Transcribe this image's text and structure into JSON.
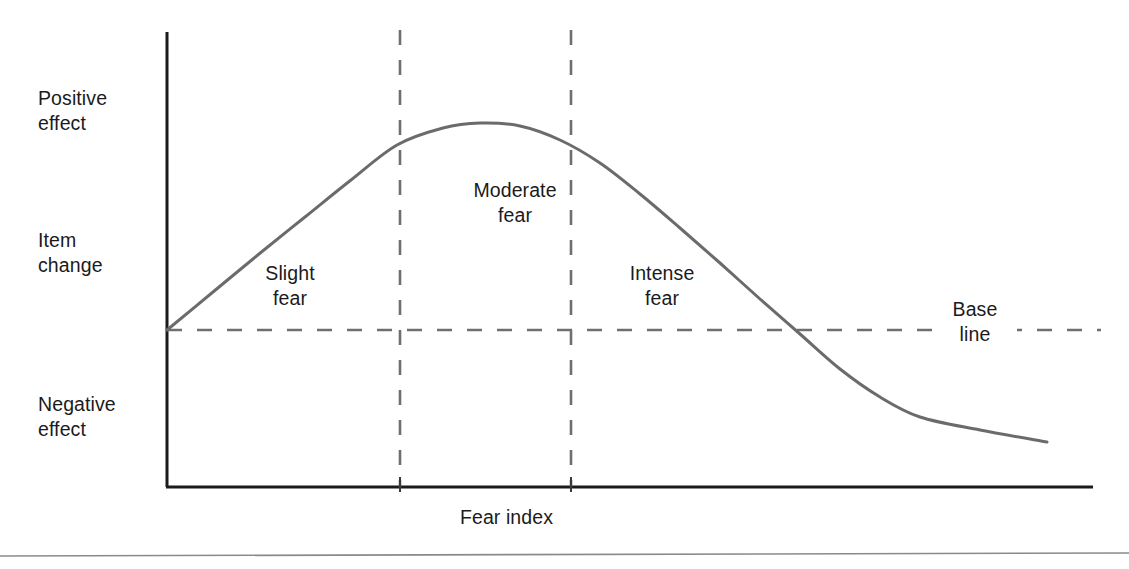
{
  "figure": {
    "background_color": "#ffffff",
    "width": 1129,
    "height": 569,
    "axis_color": "#1b1b1b",
    "curve_color": "#6b6b6b",
    "dash_color": "#6f6f6f",
    "text_color": "#1b1b1b",
    "footer_rule_color": "#808080"
  },
  "chart_data": {
    "type": "line",
    "title": "",
    "subtitle": "",
    "xlabel": "Fear index",
    "ylabel": "Item change",
    "grid": false,
    "legend_position": "none",
    "xlim": [
      0,
      100
    ],
    "ylim": [
      -1.0,
      1.25
    ],
    "axis_tick_labels": {
      "x": [],
      "y": []
    },
    "y_axis_annotations": [
      {
        "name": "positive-effect",
        "label": "Positive\neffect",
        "value": 1.0
      },
      {
        "name": "item-change",
        "label": "Item\nchange",
        "value": 0.2
      },
      {
        "name": "negative-effect",
        "label": "Negative\neffect",
        "value": -0.55
      }
    ],
    "series": [
      {
        "name": "item-change-curve",
        "color": "#6b6b6b",
        "style": "solid",
        "x": [
          0,
          5,
          10,
          15,
          20,
          25,
          30,
          33.8,
          40,
          45,
          50,
          55,
          60,
          65,
          70,
          75,
          80,
          85,
          90,
          95,
          100
        ],
        "y": [
          0.0,
          0.118,
          0.236,
          0.352,
          0.466,
          0.576,
          0.679,
          0.737,
          0.832,
          0.885,
          0.908,
          0.889,
          0.826,
          0.729,
          0.611,
          0.482,
          0.347,
          0.21,
          0.07,
          -0.07,
          -0.212
        ],
        "points_px": [
          [
            167,
            330
          ],
          [
            213,
            292
          ],
          [
            259,
            254
          ],
          [
            305,
            217
          ],
          [
            351,
            180
          ],
          [
            397,
            145
          ],
          [
            443,
            128
          ],
          [
            480,
            123
          ],
          [
            520,
            126
          ],
          [
            560,
            140
          ],
          [
            600,
            163
          ],
          [
            640,
            194
          ],
          [
            680,
            228
          ],
          [
            720,
            263
          ],
          [
            760,
            299
          ],
          [
            800,
            334
          ],
          [
            840,
            369
          ],
          [
            880,
            397
          ],
          [
            920,
            417
          ],
          [
            980,
            430
          ],
          [
            1047,
            442
          ]
        ]
      }
    ],
    "reference_lines": [
      {
        "name": "base-line",
        "orientation": "horizontal",
        "label": "Base\nline",
        "value": 0.0,
        "style": "dashed",
        "color": "#6f6f6f",
        "y_px": 330
      },
      {
        "name": "slight-moderate-divider",
        "orientation": "vertical",
        "label": "",
        "value": 25.2,
        "style": "dashed",
        "color": "#6f6f6f",
        "x_px": 400
      },
      {
        "name": "moderate-intense-divider",
        "orientation": "vertical",
        "label": "",
        "value": 43.6,
        "style": "dashed",
        "color": "#6f6f6f",
        "x_px": 571
      }
    ],
    "region_annotations": [
      {
        "name": "slight-fear",
        "label": "Slight\nfear",
        "x_range": [
          0,
          25.2
        ],
        "x_px": 290
      },
      {
        "name": "moderate-fear",
        "label": "Moderate\nfear",
        "x_range": [
          25.2,
          43.6
        ],
        "x_px": 515
      },
      {
        "name": "intense-fear",
        "label": "Intense\nfear",
        "x_range": [
          43.6,
          100
        ],
        "x_px": 662
      }
    ],
    "annotations": [
      {
        "name": "baseline-crossing",
        "label": "",
        "x": 86.4,
        "y": 0.0,
        "x_px": 872,
        "y_px": 330
      },
      {
        "name": "curve-peak",
        "label": "",
        "x": 33.8,
        "y": 0.908,
        "x_px": 480,
        "y_px": 123
      }
    ]
  },
  "labels": {
    "positive_effect": "Positive\neffect",
    "item_change": "Item\nchange",
    "negative_effect": "Negative\neffect",
    "slight_fear": "Slight\nfear",
    "moderate_fear": "Moderate\nfear",
    "intense_fear": "Intense\nfear",
    "base_line": "Base\nline",
    "fear_index": "Fear index"
  }
}
